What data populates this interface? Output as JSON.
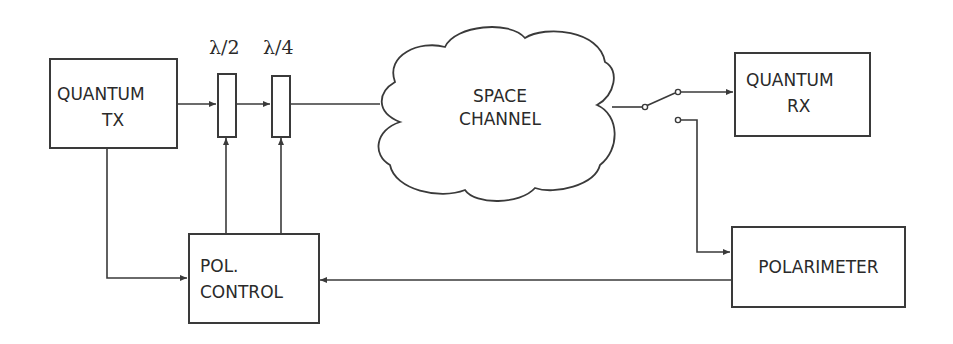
{
  "diagram": {
    "type": "block-diagram",
    "blocks": {
      "quantum_tx": {
        "line1": "QUANTUM",
        "line2": "TX"
      },
      "quantum_rx": {
        "line1": "QUANTUM",
        "line2": "RX"
      },
      "pol_control": {
        "line1": "POL.",
        "line2": "CONTROL"
      },
      "polarimeter": {
        "label": "POLARIMETER"
      },
      "space_channel": {
        "line1": "SPACE",
        "line2": "CHANNEL"
      }
    },
    "waveplates": {
      "half": {
        "label": "λ/2"
      },
      "quarter": {
        "label": "λ/4"
      }
    },
    "switch": {
      "positions": [
        "QUANTUM RX",
        "POLARIMETER"
      ],
      "selected": "QUANTUM RX"
    },
    "connections": [
      {
        "from": "QUANTUM TX",
        "to": "λ/2"
      },
      {
        "from": "λ/2",
        "to": "λ/4"
      },
      {
        "from": "λ/4",
        "to": "SPACE CHANNEL"
      },
      {
        "from": "SPACE CHANNEL",
        "to": "switch"
      },
      {
        "from": "switch",
        "to": "QUANTUM RX"
      },
      {
        "from": "switch",
        "to": "POLARIMETER"
      },
      {
        "from": "QUANTUM TX",
        "to": "POL. CONTROL"
      },
      {
        "from": "POL. CONTROL",
        "to": "λ/2"
      },
      {
        "from": "POL. CONTROL",
        "to": "λ/4"
      },
      {
        "from": "POLARIMETER",
        "to": "POL. CONTROL"
      }
    ],
    "colors": {
      "stroke": "#3a3a3a",
      "text": "#2a2a2a",
      "background": "#ffffff"
    }
  }
}
